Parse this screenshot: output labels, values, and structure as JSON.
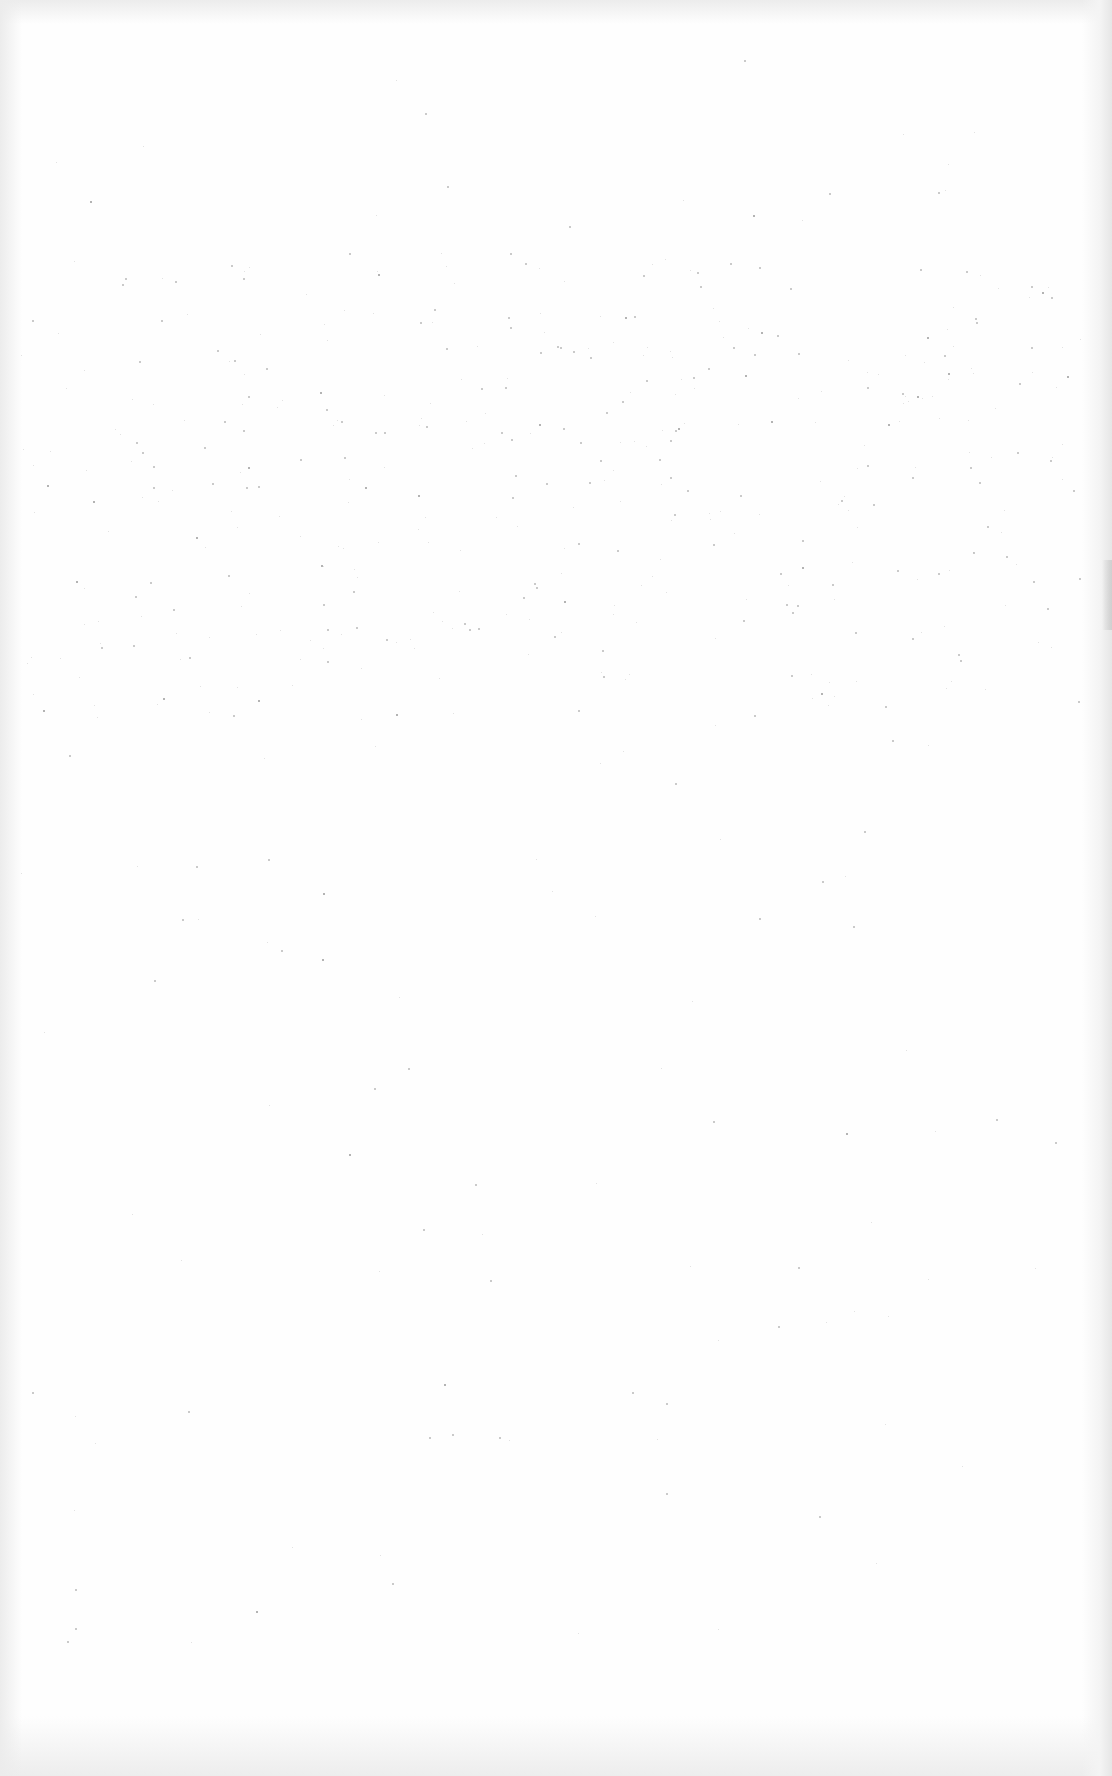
{
  "document": {
    "type": "blank-scanned-page",
    "page_background": "#fefefe",
    "edge_shade_color": "#e6e6e6",
    "text_content": []
  }
}
